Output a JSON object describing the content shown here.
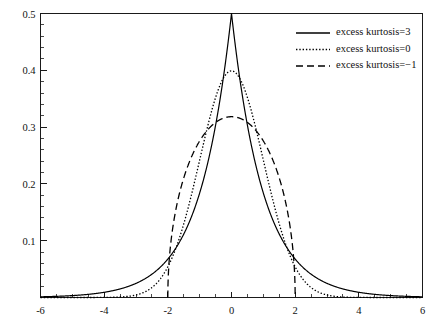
{
  "chart_data": {
    "type": "line",
    "title": "",
    "subtitle": "",
    "xlabel": "",
    "ylabel": "",
    "xlim": [
      -6,
      6
    ],
    "ylim": [
      0,
      0.5
    ],
    "grid": false,
    "legend_position": "top-right",
    "x_ticks": [
      -6,
      -4,
      -2,
      0,
      2,
      4,
      6
    ],
    "x_tick_labels": [
      "-6",
      "-4",
      "-2",
      "0",
      "2",
      "4",
      "6"
    ],
    "x_minor_tick_step": 0.5,
    "y_ticks": [
      0.1,
      0.2,
      0.3,
      0.4,
      0.5
    ],
    "y_tick_labels": [
      "0.1",
      "0.2",
      "0.3",
      "0.4",
      "0.5"
    ],
    "y_minor_tick_step": 0.02,
    "series": [
      {
        "name": "excess kurtosis=3",
        "style": "solid",
        "distribution": "laplace",
        "scale": 1,
        "peak": 0.5,
        "support": [
          -6,
          6
        ],
        "values_at_x": {
          "-6": 0.0012,
          "-5": 0.0034,
          "-4": 0.0092,
          "-3": 0.0249,
          "-2": 0.0677,
          "-1.5": 0.1116,
          "-1": 0.1839,
          "-0.5": 0.3033,
          "0": 0.5,
          "0.5": 0.3033,
          "1": 0.1839,
          "1.5": 0.1116,
          "2": 0.0677,
          "3": 0.0249,
          "4": 0.0092,
          "5": 0.0034,
          "6": 0.0012
        }
      },
      {
        "name": "excess kurtosis=0",
        "style": "dotted",
        "distribution": "normal",
        "scale": 1,
        "peak": 0.3989,
        "support": [
          -6,
          6
        ],
        "values_at_x": {
          "-6": 0.0,
          "-5": 0.0,
          "-4": 0.0001,
          "-3": 0.0044,
          "-2": 0.054,
          "-1.5": 0.1295,
          "-1": 0.242,
          "-0.5": 0.3521,
          "0": 0.3989,
          "0.5": 0.3521,
          "1": 0.242,
          "1.5": 0.1295,
          "2": 0.054,
          "3": 0.0044,
          "4": 0.0001,
          "5": 0.0,
          "6": 0.0
        }
      },
      {
        "name": "excess kurtosis=-1",
        "style": "dashed",
        "distribution": "wigner-semicircle",
        "radius": 2,
        "peak": 0.3183,
        "support": [
          -2,
          2
        ],
        "values_at_x": {
          "-2": 0.0,
          "-1.9": 0.0981,
          "-1.75": 0.1399,
          "-1.5": 0.2105,
          "-1": 0.2757,
          "-0.5": 0.3084,
          "0": 0.3183,
          "0.5": 0.3084,
          "1": 0.2757,
          "1.5": 0.2105,
          "1.75": 0.1399,
          "1.9": 0.0981,
          "2": 0.0
        }
      }
    ]
  },
  "legend": {
    "items": [
      {
        "label": "excess kurtosis=3",
        "style": "solid"
      },
      {
        "label": "excess kurtosis=0",
        "style": "dotted"
      },
      {
        "label": "excess kurtosis=−1",
        "style": "dashed"
      }
    ]
  }
}
